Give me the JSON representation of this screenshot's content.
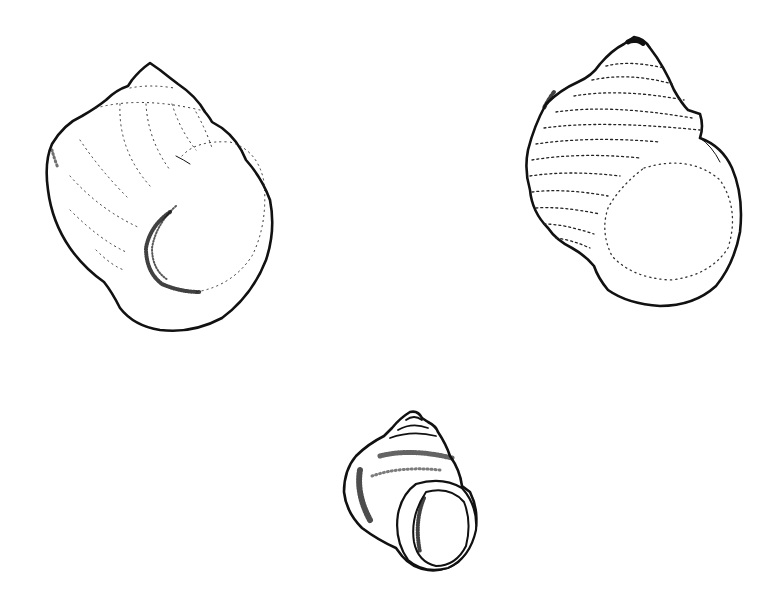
{
  "figure": {
    "background_color": "#ffffff",
    "ink_color": "#111111",
    "specimens": [
      {
        "id": "shell-left",
        "position": "top-left",
        "form": "smooth globose shell with dotted growth lines"
      },
      {
        "id": "shell-right",
        "position": "top-right",
        "form": "spirally ribbed turbinate shell"
      },
      {
        "id": "shell-bottom",
        "position": "bottom-center",
        "form": "small stippled shell with thickened round aperture"
      }
    ]
  }
}
